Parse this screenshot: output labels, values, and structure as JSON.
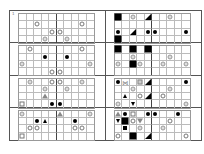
{
  "corner_label": "1",
  "center_divider_after_column": 4,
  "grid_size": {
    "columns": 10,
    "rows": 4
  },
  "symbol_legend": {
    "open-circle": "○",
    "gray-circle": "◎",
    "black-dot": "●",
    "black-square": "■",
    "small-black-square": "▪",
    "open-square": "□",
    "gray-x-square": "⊠",
    "black-triangle-corner": "◢",
    "black-triangle-up": "▲",
    "black-triangle-down": "▼",
    "open-triangle-up": "△",
    "open-triangle-down": "▽",
    "open-x": "⋈"
  },
  "panels": [
    {
      "id": "r1-left",
      "items": [
        {
          "r": 1,
          "c": 2,
          "s": "open-circle"
        },
        {
          "r": 1,
          "c": 8,
          "s": "open-circle"
        },
        {
          "r": 2,
          "c": 4,
          "s": "open-circle"
        },
        {
          "r": 2,
          "c": 5,
          "s": "open-circle"
        },
        {
          "r": 3,
          "c": 3,
          "s": "gray-circle"
        },
        {
          "r": 3,
          "c": 6,
          "s": "gray-circle"
        }
      ]
    },
    {
      "id": "r1-right",
      "items": [
        {
          "r": 0,
          "c": 0,
          "s": "black-square"
        },
        {
          "r": 0,
          "c": 2,
          "s": "gray-circle"
        },
        {
          "r": 0,
          "c": 4,
          "s": "black-triangle-corner"
        },
        {
          "r": 0,
          "c": 7,
          "s": "gray-circle"
        },
        {
          "r": 2,
          "c": 0,
          "s": "black-dot"
        },
        {
          "r": 2,
          "c": 2,
          "s": "black-triangle-corner"
        },
        {
          "r": 2,
          "c": 4,
          "s": "black-dot"
        },
        {
          "r": 2,
          "c": 5,
          "s": "black-dot"
        },
        {
          "r": 2,
          "c": 9,
          "s": "black-dot"
        },
        {
          "r": 3,
          "c": 0,
          "s": "black-square"
        }
      ]
    },
    {
      "id": "r2-left",
      "items": [
        {
          "r": 0,
          "c": 1,
          "s": "open-circle"
        },
        {
          "r": 0,
          "c": 8,
          "s": "open-circle"
        },
        {
          "r": 1,
          "c": 3,
          "s": "black-dot"
        },
        {
          "r": 1,
          "c": 6,
          "s": "black-dot"
        },
        {
          "r": 2,
          "c": 0,
          "s": "gray-circle"
        },
        {
          "r": 2,
          "c": 9,
          "s": "gray-circle"
        },
        {
          "r": 3,
          "c": 4,
          "s": "open-circle"
        },
        {
          "r": 3,
          "c": 5,
          "s": "open-circle"
        }
      ]
    },
    {
      "id": "r2-right",
      "items": [
        {
          "r": 0,
          "c": 0,
          "s": "black-square"
        },
        {
          "r": 0,
          "c": 2,
          "s": "black-square"
        },
        {
          "r": 0,
          "c": 4,
          "s": "black-square"
        },
        {
          "r": 1,
          "c": 2,
          "s": "gray-circle"
        },
        {
          "r": 1,
          "c": 7,
          "s": "gray-circle"
        },
        {
          "r": 2,
          "c": 0,
          "s": "gray-circle"
        },
        {
          "r": 2,
          "c": 2,
          "s": "black-square"
        },
        {
          "r": 2,
          "c": 3,
          "s": "gray-circle"
        },
        {
          "r": 2,
          "c": 6,
          "s": "gray-circle"
        },
        {
          "r": 2,
          "c": 9,
          "s": "gray-circle"
        }
      ]
    },
    {
      "id": "r3-left",
      "items": [
        {
          "r": 0,
          "c": 1,
          "s": "gray-circle"
        },
        {
          "r": 0,
          "c": 4,
          "s": "open-circle"
        },
        {
          "r": 0,
          "c": 5,
          "s": "open-circle"
        },
        {
          "r": 0,
          "c": 8,
          "s": "gray-circle"
        },
        {
          "r": 1,
          "c": 3,
          "s": "gray-circle"
        },
        {
          "r": 1,
          "c": 6,
          "s": "gray-circle"
        },
        {
          "r": 2,
          "c": 3,
          "s": "open-triangle-up"
        },
        {
          "r": 3,
          "c": 0,
          "s": "open-square"
        },
        {
          "r": 3,
          "c": 4,
          "s": "black-dot"
        },
        {
          "r": 3,
          "c": 5,
          "s": "black-dot"
        }
      ]
    },
    {
      "id": "r3-right",
      "items": [
        {
          "r": 0,
          "c": 0,
          "s": "black-dot"
        },
        {
          "r": 0,
          "c": 1,
          "s": "open-x"
        },
        {
          "r": 0,
          "c": 3,
          "s": "gray-x-square"
        },
        {
          "r": 0,
          "c": 4,
          "s": "black-triangle-corner"
        },
        {
          "r": 0,
          "c": 9,
          "s": "black-dot"
        },
        {
          "r": 1,
          "c": 2,
          "s": "gray-circle"
        },
        {
          "r": 1,
          "c": 7,
          "s": "gray-circle"
        },
        {
          "r": 2,
          "c": 1,
          "s": "black-triangle-up"
        },
        {
          "r": 2,
          "c": 3,
          "s": "open-circle"
        },
        {
          "r": 2,
          "c": 4,
          "s": "black-triangle-corner"
        },
        {
          "r": 2,
          "c": 6,
          "s": "open-circle"
        },
        {
          "r": 3,
          "c": 0,
          "s": "gray-circle"
        },
        {
          "r": 3,
          "c": 2,
          "s": "black-triangle-down"
        },
        {
          "r": 3,
          "c": 9,
          "s": "gray-circle"
        }
      ]
    },
    {
      "id": "r4-left",
      "items": [
        {
          "r": 0,
          "c": 0,
          "s": "gray-circle"
        },
        {
          "r": 0,
          "c": 5,
          "s": "open-triangle-up"
        },
        {
          "r": 0,
          "c": 9,
          "s": "gray-circle"
        },
        {
          "r": 1,
          "c": 2,
          "s": "black-dot"
        },
        {
          "r": 1,
          "c": 3,
          "s": "black-triangle-up"
        },
        {
          "r": 1,
          "c": 7,
          "s": "black-dot"
        },
        {
          "r": 2,
          "c": 1,
          "s": "open-circle"
        },
        {
          "r": 2,
          "c": 2,
          "s": "open-circle"
        },
        {
          "r": 2,
          "c": 7,
          "s": "open-circle"
        },
        {
          "r": 2,
          "c": 8,
          "s": "open-circle"
        },
        {
          "r": 3,
          "c": 0,
          "s": "open-square"
        }
      ]
    },
    {
      "id": "r4-right",
      "items": [
        {
          "r": 0,
          "c": 0,
          "s": "open-triangle-up"
        },
        {
          "r": 0,
          "c": 1,
          "s": "black-dot"
        },
        {
          "r": 0,
          "c": 2,
          "s": "open-square"
        },
        {
          "r": 0,
          "c": 4,
          "s": "black-dot"
        },
        {
          "r": 0,
          "c": 5,
          "s": "black-dot"
        },
        {
          "r": 0,
          "c": 8,
          "s": "black-dot"
        },
        {
          "r": 1,
          "c": 0,
          "s": "black-triangle-down"
        },
        {
          "r": 1,
          "c": 1,
          "s": "black-square"
        },
        {
          "r": 1,
          "c": 2,
          "s": "open-circle"
        },
        {
          "r": 1,
          "c": 3,
          "s": "open-triangle-down"
        },
        {
          "r": 1,
          "c": 7,
          "s": "open-circle"
        },
        {
          "r": 2,
          "c": 1,
          "s": "small-black-square"
        },
        {
          "r": 2,
          "c": 3,
          "s": "gray-circle"
        },
        {
          "r": 2,
          "c": 6,
          "s": "gray-circle"
        },
        {
          "r": 3,
          "c": 0,
          "s": "open-circle"
        },
        {
          "r": 3,
          "c": 2,
          "s": "black-square"
        },
        {
          "r": 3,
          "c": 4,
          "s": "black-triangle-corner"
        },
        {
          "r": 3,
          "c": 9,
          "s": "open-circle"
        }
      ]
    }
  ]
}
